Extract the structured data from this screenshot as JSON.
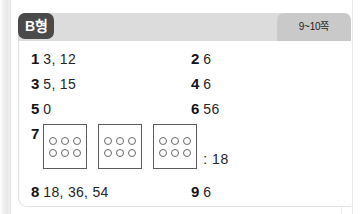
{
  "header": {
    "type_badge": "B형",
    "page_range": "9~10쪽"
  },
  "answers": {
    "row1": {
      "left": {
        "number": "1",
        "value": "3, 12"
      },
      "right": {
        "number": "2",
        "value": "6"
      }
    },
    "row2": {
      "left": {
        "number": "3",
        "value": "5, 15"
      },
      "right": {
        "number": "4",
        "value": "6"
      }
    },
    "row3": {
      "left": {
        "number": "5",
        "value": "0"
      },
      "right": {
        "number": "6",
        "value": "56"
      }
    },
    "item7": {
      "number": "7",
      "boxes": [
        {
          "rows": [
            3,
            3
          ]
        },
        {
          "rows": [
            3,
            3
          ]
        },
        {
          "rows": [
            3,
            3
          ]
        }
      ],
      "result": ": 18"
    },
    "row4": {
      "left": {
        "number": "8",
        "value": "18, 36, 54"
      },
      "right": {
        "number": "9",
        "value": "6"
      }
    }
  },
  "colors": {
    "header_bar": "#dcdcdc",
    "page_badge": "#c9c9c9",
    "type_badge": "#4a4a4a",
    "panel": "#ffffff",
    "text": "#262626"
  }
}
